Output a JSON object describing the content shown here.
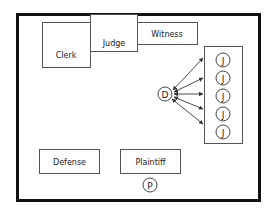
{
  "diagram": {
    "colors": {
      "frame": "#111111",
      "box_stroke": "#555555",
      "arrow": "#333333"
    },
    "boxes": [
      {
        "id": "clerk",
        "label": "Clerk"
      },
      {
        "id": "judge",
        "label": "Judge"
      },
      {
        "id": "witness",
        "label": "Witness"
      },
      {
        "id": "defense",
        "label": "Defense"
      },
      {
        "id": "plaintiff",
        "label": "Plaintiff"
      }
    ],
    "nodes": {
      "defendant": "D",
      "plaintiff_person": "P",
      "jurors": [
        "J",
        "J",
        "J",
        "J",
        "J"
      ]
    },
    "edges": "D -> each J (5 arrows)"
  }
}
